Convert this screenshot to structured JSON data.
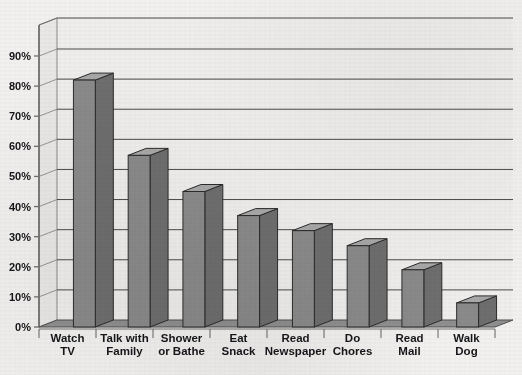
{
  "chart_data": {
    "type": "bar",
    "title": "",
    "xlabel": "",
    "ylabel": "",
    "ylim": [
      0,
      90
    ],
    "ytick_step": 10,
    "grid": true,
    "legend": null,
    "style": "3d-column",
    "categories": [
      "Watch TV",
      "Talk with Family",
      "Shower or Bathe",
      "Eat Snack",
      "Read Newspaper",
      "Do Chores",
      "Read Mail",
      "Walk Dog"
    ],
    "category_lines": [
      [
        "Watch",
        "TV"
      ],
      [
        "Talk with",
        "Family"
      ],
      [
        "Shower",
        "or Bathe"
      ],
      [
        "Eat",
        "Snack"
      ],
      [
        "Read",
        "Newspaper"
      ],
      [
        "Do",
        "Chores"
      ],
      [
        "Read",
        "Mail"
      ],
      [
        "Walk",
        "Dog"
      ]
    ],
    "values": [
      82,
      57,
      45,
      37,
      32,
      27,
      19,
      8
    ],
    "yticks": [
      "0%",
      "10%",
      "20%",
      "30%",
      "40%",
      "50%",
      "60%",
      "70%",
      "80%",
      "90%"
    ],
    "ytick_values": [
      0,
      10,
      20,
      30,
      40,
      50,
      60,
      70,
      80,
      90
    ],
    "colors": {
      "bar_front": "#8a8a8a",
      "bar_top": "#a8a8a8",
      "bar_side": "#6e6e6e",
      "bar_outline": "#2b2b2b",
      "plot_background": "#efeeec",
      "floor": "#8f8f8f",
      "gridline": "#4a4a4a",
      "axis": "#6f6f6f",
      "page_background": "#f2f1ef",
      "text": "#16161a"
    }
  }
}
